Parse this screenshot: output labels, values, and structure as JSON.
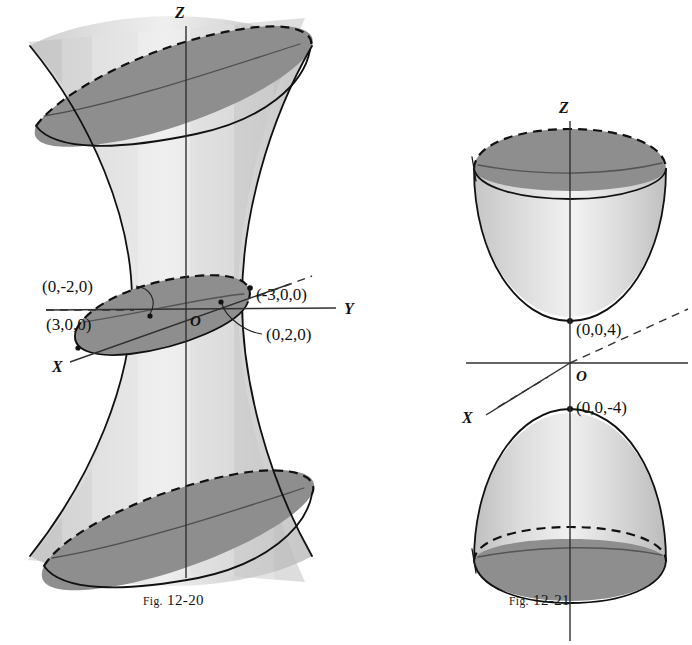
{
  "page": {
    "background_color": "#ffffff",
    "ink_color": "#111111",
    "surface_light_color": "#dcdcdc",
    "surface_mid_color": "#c4c4c4",
    "ellipse_dark_color": "#8e8e8e"
  },
  "figures": [
    {
      "id": "fig-12-20",
      "caption_prefix": "Fig.",
      "caption_number": "12-20",
      "surface_name": "hyperboloid-of-one-sheet",
      "axes": [
        {
          "name": "z-axis",
          "label": "Z"
        },
        {
          "name": "y-axis",
          "label": "Y"
        },
        {
          "name": "x-axis",
          "label": "X"
        }
      ],
      "origin_label": "O",
      "points": [
        {
          "name": "point-0-neg2-0",
          "label": "(0,-2,0)"
        },
        {
          "name": "point-3-0-0",
          "label": "(3,0,0)"
        },
        {
          "name": "point-neg3-0-0",
          "label": "(-3,0,0)"
        },
        {
          "name": "point-0-2-0",
          "label": "(0,2,0)"
        }
      ]
    },
    {
      "id": "fig-12-21",
      "caption_prefix": "Fig.",
      "caption_number": "12-21",
      "surface_name": "hyperboloid-of-two-sheets",
      "axes": [
        {
          "name": "z-axis",
          "label": "Z"
        },
        {
          "name": "x-axis",
          "label": "X"
        }
      ],
      "origin_label": "O",
      "points": [
        {
          "name": "point-0-0-4",
          "label": "(0,0,4)"
        },
        {
          "name": "point-0-0-neg4",
          "label": "(0,0,-4)"
        }
      ]
    }
  ]
}
